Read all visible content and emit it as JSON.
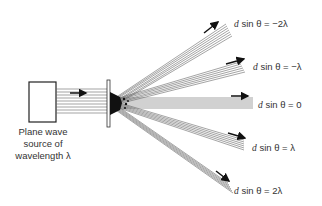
{
  "diagram": {
    "source": {
      "label_line1": "Plane wave",
      "label_line2": "source of",
      "label_line3": "wavelength λ"
    },
    "orders": [
      {
        "order": -2,
        "label": "d sin θ = −2λ",
        "var": "d",
        "rest": " sin θ = −2λ"
      },
      {
        "order": -1,
        "label": "d sin θ = −λ",
        "var": "d",
        "rest": " sin θ = −λ"
      },
      {
        "order": 0,
        "label": "d sin θ = 0",
        "var": "d",
        "rest": " sin θ = 0"
      },
      {
        "order": 1,
        "label": "d sin θ = λ",
        "var": "d",
        "rest": " sin θ = λ"
      },
      {
        "order": 2,
        "label": "d sin θ = 2λ",
        "var": "d",
        "rest": " sin θ = 2λ"
      }
    ],
    "colors": {
      "line": "#555555",
      "arrow": "#111111",
      "box": "#222222"
    }
  }
}
